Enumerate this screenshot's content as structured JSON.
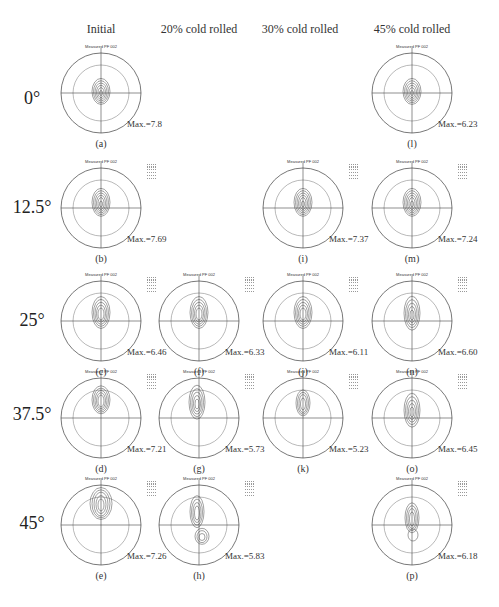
{
  "figure": {
    "column_headers": [
      "Initial",
      "20% cold rolled",
      "30% cold rolled",
      "45% cold rolled"
    ],
    "row_labels": [
      "0°",
      "12.5°",
      "25°",
      "37.5°",
      "45°"
    ],
    "pole_figure_title": "Measured PF 002",
    "panels": [
      {
        "id": "a",
        "label": "(a)",
        "col": 0,
        "row": 0,
        "max": "Max.=7.8",
        "shape": "center",
        "legend": false
      },
      {
        "id": "l",
        "label": "(l)",
        "col": 3,
        "row": 0,
        "max": "Max.=6.23",
        "shape": "center",
        "legend": false
      },
      {
        "id": "b",
        "label": "(b)",
        "col": 0,
        "row": 1,
        "max": "Max.=7.69",
        "shape": "up-center",
        "legend": true
      },
      {
        "id": "i",
        "label": "(i)",
        "col": 2,
        "row": 1,
        "max": "Max.=7.37",
        "shape": "up-center",
        "legend": true
      },
      {
        "id": "m",
        "label": "(m)",
        "col": 3,
        "row": 1,
        "max": "Max.=7.24",
        "shape": "up-center",
        "legend": true
      },
      {
        "id": "c",
        "label": "(c)",
        "col": 0,
        "row": 2,
        "max": "Max.=6.46",
        "shape": "up",
        "legend": true
      },
      {
        "id": "f",
        "label": "(f)",
        "col": 1,
        "row": 2,
        "max": "Max.=6.33",
        "shape": "up",
        "legend": true
      },
      {
        "id": "j",
        "label": "(j)",
        "col": 2,
        "row": 2,
        "max": "Max.=6.11",
        "shape": "up",
        "legend": true
      },
      {
        "id": "n",
        "label": "(n)",
        "col": 3,
        "row": 2,
        "max": "Max.=6.60",
        "shape": "up-tail",
        "legend": true
      },
      {
        "id": "d",
        "label": "(d)",
        "col": 0,
        "row": 3,
        "max": "Max.=7.21",
        "shape": "high",
        "legend": true
      },
      {
        "id": "g",
        "label": "(g)",
        "col": 1,
        "row": 3,
        "max": "Max.=5.73",
        "shape": "split",
        "legend": true
      },
      {
        "id": "k",
        "label": "(k)",
        "col": 2,
        "row": 3,
        "max": "Max.=5.23",
        "shape": "high-small",
        "legend": true
      },
      {
        "id": "o",
        "label": "(o)",
        "col": 3,
        "row": 3,
        "max": "Max.=6.45",
        "shape": "up-tail",
        "legend": true
      },
      {
        "id": "e",
        "label": "(e)",
        "col": 0,
        "row": 4,
        "max": "Max.=7.26",
        "shape": "top",
        "legend": true
      },
      {
        "id": "h",
        "label": "(h)",
        "col": 1,
        "row": 4,
        "max": "Max.=5.83",
        "shape": "double",
        "legend": true
      },
      {
        "id": "p",
        "label": "(p)",
        "col": 3,
        "row": 4,
        "max": "Max.=6.18",
        "shape": "up-lobe",
        "legend": true
      }
    ]
  },
  "colors": {
    "circle": "#555555",
    "inner_circle": "#8a8a8a",
    "contour": "#444444",
    "axes": "#444444"
  }
}
